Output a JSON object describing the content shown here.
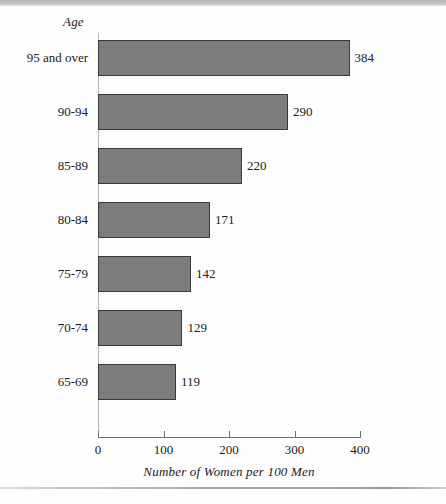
{
  "chart_data": {
    "type": "bar",
    "orientation": "horizontal",
    "title": "",
    "xlabel": "Number of Women per 100 Men",
    "ylabel": "Age",
    "categories": [
      "95 and over",
      "90-94",
      "85-89",
      "80-84",
      "75-79",
      "70-74",
      "65-69"
    ],
    "values": [
      384,
      290,
      220,
      171,
      142,
      129,
      119
    ],
    "value_labels": [
      "384",
      "290",
      "220",
      "171",
      "142",
      "129",
      "119"
    ],
    "xlim": [
      0,
      400
    ],
    "xticks": [
      0,
      100,
      200,
      300,
      400
    ],
    "xtick_labels": [
      "0",
      "100",
      "200",
      "300",
      "400"
    ],
    "grid": false,
    "legend": false,
    "bar_fill_color": "#7c7c7c",
    "bar_edge_color": "#3a3a3a",
    "axis_color": "#6e6e6e",
    "background_color": "#ffffff",
    "text_color": "#1a1a1a"
  }
}
